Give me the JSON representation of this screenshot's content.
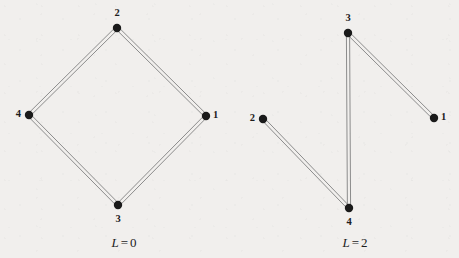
{
  "figure": {
    "width": 459,
    "height": 258,
    "background_color": "#f1efed",
    "edge_color": "#8c8c8c",
    "node_color": "#1a1a1a",
    "label_color": "#1d1d1d",
    "node_radius": 4.2,
    "edge_gap": 3.2
  },
  "graphs": [
    {
      "id": "graph-left",
      "caption": {
        "symbol": "L",
        "operator": "=",
        "value": "0",
        "text": "L = 0",
        "x": 124,
        "y": 235
      },
      "nodes": [
        {
          "id": "n1",
          "label": "1",
          "x": 206,
          "y": 116,
          "label_x": 213,
          "label_y": 110,
          "label_anchor": "left"
        },
        {
          "id": "n2",
          "label": "2",
          "x": 117,
          "y": 28,
          "label_x": 117,
          "label_y": 8,
          "label_anchor": "above"
        },
        {
          "id": "n3",
          "label": "3",
          "x": 118,
          "y": 205,
          "label_x": 118,
          "label_y": 214,
          "label_anchor": "below"
        },
        {
          "id": "n4",
          "label": "4",
          "x": 29,
          "y": 115,
          "label_x": 21,
          "label_y": 109,
          "label_anchor": "right"
        }
      ],
      "edges": [
        {
          "from": "n2",
          "to": "n1"
        },
        {
          "from": "n2",
          "to": "n4"
        },
        {
          "from": "n4",
          "to": "n3"
        },
        {
          "from": "n3",
          "to": "n1"
        }
      ]
    },
    {
      "id": "graph-right",
      "caption": {
        "symbol": "L",
        "operator": "=",
        "value": "2",
        "text": "L = 2",
        "x": 355,
        "y": 235
      },
      "nodes": [
        {
          "id": "m1",
          "label": "1",
          "x": 434,
          "y": 118,
          "label_x": 441,
          "label_y": 112,
          "label_anchor": "left"
        },
        {
          "id": "m2",
          "label": "2",
          "x": 263,
          "y": 119,
          "label_x": 255,
          "label_y": 113,
          "label_anchor": "right"
        },
        {
          "id": "m3",
          "label": "3",
          "x": 348,
          "y": 33,
          "label_x": 348,
          "label_y": 13,
          "label_anchor": "above"
        },
        {
          "id": "m4",
          "label": "4",
          "x": 349,
          "y": 208,
          "label_x": 349,
          "label_y": 217,
          "label_anchor": "below"
        }
      ],
      "edges": [
        {
          "from": "m3",
          "to": "m1"
        },
        {
          "from": "m3",
          "to": "m4"
        },
        {
          "from": "m2",
          "to": "m4"
        }
      ]
    }
  ]
}
